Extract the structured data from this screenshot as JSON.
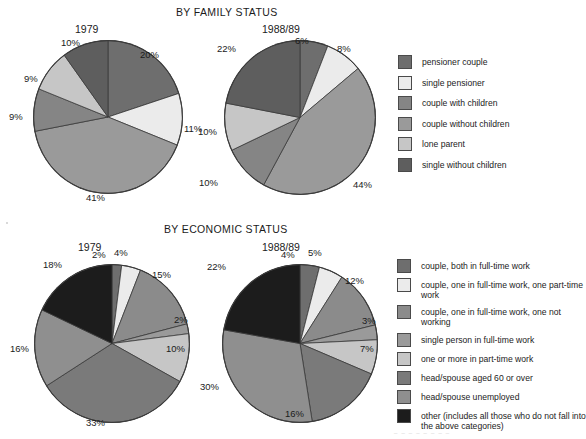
{
  "page": {
    "background": "#ffffff",
    "footer_note": "_ _   _  _   _ _   _ _"
  },
  "palette": {
    "dark_gray": "#6e6e6e",
    "near_white": "#ebebeb",
    "mid_dark_gray": "#858585",
    "mid_gray": "#9a9a9a",
    "light_gray": "#c6c6c6",
    "darker_gray": "#5e5e5e",
    "black": "#1c1c1c",
    "slice_outline": "#3a3a3a",
    "text": "#1b1b1b"
  },
  "sections": [
    {
      "id": "family",
      "title": "BY FAMILY STATUS",
      "charts": [
        {
          "id": "family-1979",
          "year": "1979"
        },
        {
          "id": "family-1988",
          "year": "1988/89"
        }
      ],
      "legend": [
        {
          "label": "pensioner couple",
          "color": "#6e6e6e"
        },
        {
          "label": "single pensioner",
          "color": "#ebebeb"
        },
        {
          "label": "couple with children",
          "color": "#858585"
        },
        {
          "label": "couple without children",
          "color": "#9a9a9a"
        },
        {
          "label": "lone parent",
          "color": "#c6c6c6"
        },
        {
          "label": "single without children",
          "color": "#5e5e5e"
        }
      ]
    },
    {
      "id": "economic",
      "title": "BY ECONOMIC STATUS",
      "charts": [
        {
          "id": "economic-1979",
          "year": "1979"
        },
        {
          "id": "economic-1988",
          "year": "1988/89"
        }
      ],
      "legend": [
        {
          "label": "couple, both in full-time work",
          "color": "#6e6e6e"
        },
        {
          "label": "couple, one in full-time work, one part-time work",
          "color": "#ebebeb"
        },
        {
          "label": "couple, one in full-time work, one not working",
          "color": "#8b8b8b"
        },
        {
          "label": "single person in full-time work",
          "color": "#9a9a9a"
        },
        {
          "label": "one or more in part-time work",
          "color": "#c6c6c6"
        },
        {
          "label": "head/spouse aged 60 or over",
          "color": "#7a7a7a"
        },
        {
          "label": "head/spouse unemployed",
          "color": "#8f8f8f"
        },
        {
          "label": "other (includes all those who do not fall into\nthe above categories)",
          "color": "#1c1c1c"
        }
      ]
    }
  ],
  "chart_data": [
    {
      "type": "pie",
      "id": "family-1979",
      "title": "BY FAMILY STATUS",
      "subtitle": "1979",
      "start_angle_deg": 0,
      "direction": "clockwise",
      "labels": [
        "pensioner couple",
        "single pensioner",
        "couple with children",
        "couple without children",
        "lone parent",
        "single without children"
      ],
      "values": [
        20,
        11,
        41,
        9,
        9,
        10
      ],
      "value_labels": [
        "20%",
        "11%",
        "41%",
        "9%",
        "9%",
        "10%"
      ],
      "colors": [
        "#6e6e6e",
        "#ebebeb",
        "#9a9a9a",
        "#858585",
        "#c6c6c6",
        "#5e5e5e"
      ]
    },
    {
      "type": "pie",
      "id": "family-1988",
      "title": "BY FAMILY STATUS",
      "subtitle": "1988/89",
      "start_angle_deg": 0,
      "direction": "clockwise",
      "labels": [
        "pensioner couple",
        "single pensioner",
        "couple with children",
        "couple without children",
        "lone parent",
        "single without children"
      ],
      "values": [
        6,
        8,
        44,
        10,
        10,
        22
      ],
      "value_labels": [
        "6%",
        "8%",
        "44%",
        "10%",
        "10%",
        "22%"
      ],
      "colors": [
        "#6e6e6e",
        "#ebebeb",
        "#9a9a9a",
        "#858585",
        "#c6c6c6",
        "#5e5e5e"
      ]
    },
    {
      "type": "pie",
      "id": "economic-1979",
      "title": "BY ECONOMIC STATUS",
      "subtitle": "1979",
      "start_angle_deg": 0,
      "direction": "clockwise",
      "labels": [
        "couple, both in full-time work",
        "couple, one in full-time work, one part-time work",
        "couple, one in full-time work, one not working",
        "single person in full-time work",
        "one or more in part-time work",
        "head/spouse aged 60 or over",
        "head/spouse unemployed",
        "other (includes all those who do not fall into the above categories)"
      ],
      "values": [
        2,
        4,
        15,
        2,
        10,
        33,
        16,
        18
      ],
      "value_labels": [
        "2%",
        "4%",
        "15%",
        "2%",
        "10%",
        "33%",
        "16%",
        "18%"
      ],
      "colors": [
        "#6e6e6e",
        "#ebebeb",
        "#8b8b8b",
        "#9a9a9a",
        "#c6c6c6",
        "#7a7a7a",
        "#8f8f8f",
        "#1c1c1c"
      ]
    },
    {
      "type": "pie",
      "id": "economic-1988",
      "title": "BY ECONOMIC STATUS",
      "subtitle": "1988/89",
      "start_angle_deg": 0,
      "direction": "clockwise",
      "labels": [
        "couple, both in full-time work",
        "couple, one in full-time work, one part-time work",
        "couple, one in full-time work, one not working",
        "single person in full-time work",
        "one or more in part-time work",
        "head/spouse aged 60 or over",
        "head/spouse unemployed",
        "other (includes all those who do not fall into the above categories)"
      ],
      "values": [
        4,
        5,
        12,
        3,
        7,
        16,
        30,
        22
      ],
      "value_labels": [
        "4%",
        "5%",
        "12%",
        "3%",
        "7%",
        "16%",
        "30%",
        "22%"
      ],
      "colors": [
        "#6e6e6e",
        "#ebebeb",
        "#8b8b8b",
        "#9a9a9a",
        "#c6c6c6",
        "#7a7a7a",
        "#8f8f8f",
        "#1c1c1c"
      ]
    }
  ]
}
